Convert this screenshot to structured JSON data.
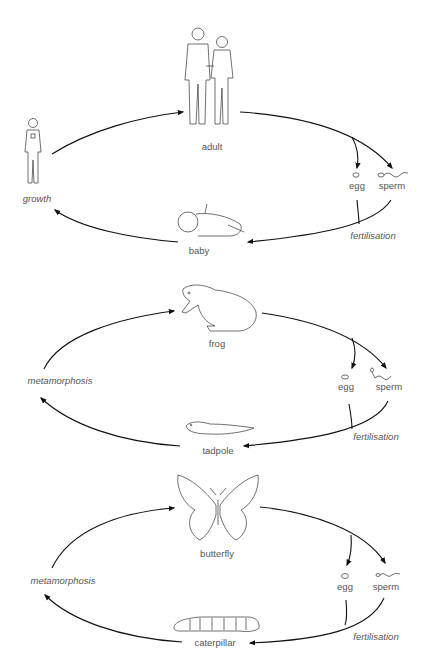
{
  "diagram": {
    "cycles": [
      {
        "name": "human",
        "top_label": "adult",
        "bottom_label": "baby",
        "left_label": "growth",
        "gamete_labels": {
          "egg": "egg",
          "sperm": "sperm"
        },
        "joining_label": "fertilisation"
      },
      {
        "name": "frog",
        "top_label": "frog",
        "bottom_label": "tadpole",
        "left_label": "metamorphosis",
        "gamete_labels": {
          "egg": "egg",
          "sperm": "sperm"
        },
        "joining_label": "fertilisation"
      },
      {
        "name": "butterfly",
        "top_label": "butterfly",
        "bottom_label": "caterpillar",
        "left_label": "metamorphosis",
        "gamete_labels": {
          "egg": "egg",
          "sperm": "sperm"
        },
        "joining_label": "fertilisation"
      }
    ]
  }
}
